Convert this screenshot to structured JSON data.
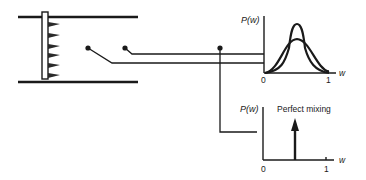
{
  "diagram": {
    "top_plot": {
      "y_label": "P(w)",
      "x_label": "w",
      "x_ticks": [
        "0",
        "1"
      ],
      "curves": [
        "narrow peaked distribution",
        "broad distribution"
      ]
    },
    "bottom_plot": {
      "y_label": "P(w)",
      "x_label": "w",
      "x_ticks": [
        "0",
        "1"
      ],
      "annotation": "Perfect mixing"
    },
    "probe_points": 3,
    "injector_jets": 6
  },
  "colors": {
    "ink": "#1a1a1a",
    "background": "#ffffff"
  }
}
